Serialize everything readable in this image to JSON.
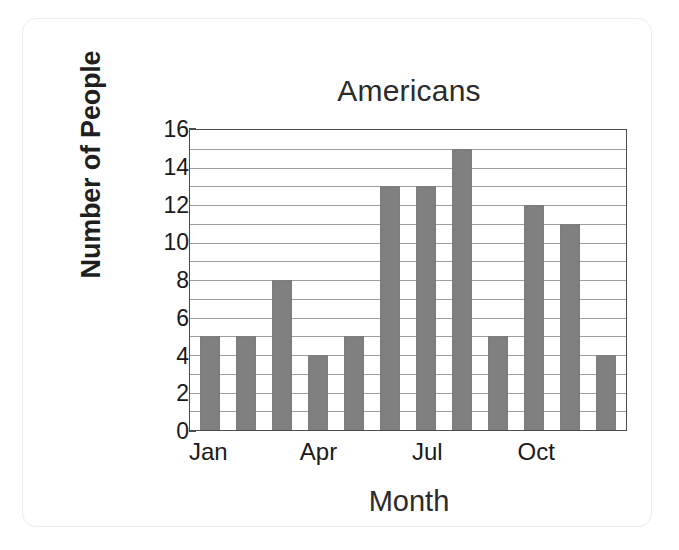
{
  "chart_data": {
    "type": "bar",
    "title": "Americans",
    "xlabel": "Month",
    "ylabel": "Number of People",
    "categories": [
      "Jan",
      "Feb",
      "Mar",
      "Apr",
      "May",
      "Jun",
      "Jul",
      "Aug",
      "Sep",
      "Oct",
      "Nov",
      "Dec"
    ],
    "values": [
      5,
      5,
      8,
      4,
      5,
      13,
      13,
      15,
      5,
      12,
      11,
      4
    ],
    "x_tick_labels": [
      "Jan",
      "",
      "",
      "Apr",
      "",
      "",
      "Jul",
      "",
      "",
      "Oct",
      "",
      ""
    ],
    "y_tick_labels": [
      "0",
      "2",
      "4",
      "6",
      "8",
      "10",
      "12",
      "14",
      "16"
    ],
    "y_ticks": [
      0,
      2,
      4,
      6,
      8,
      10,
      12,
      14,
      16
    ],
    "ylim": [
      0,
      16
    ],
    "gridlines_every": 1,
    "grid": true,
    "legend": false,
    "bar_color": "#808080",
    "axis_color": "#4a4a4a",
    "grid_color": "#8d8d8d",
    "text_color": "#1a1a1a",
    "background": "#ffffff"
  }
}
